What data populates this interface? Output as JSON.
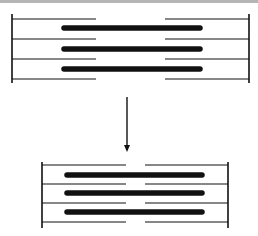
{
  "diagram": {
    "colors": {
      "stroke": "#111111",
      "topbar": "#b5b5b5",
      "background": "#ffffff"
    },
    "relaxed": {
      "z_lines_x": [
        12,
        249
      ],
      "z_line_y": [
        14,
        83
      ],
      "thin_filament_y": [
        19,
        39,
        59,
        79
      ],
      "thin_left": [
        12,
        96
      ],
      "thin_right": [
        165,
        249
      ],
      "thick_filament_y": [
        28,
        49,
        69
      ],
      "thick_x": [
        64,
        200
      ]
    },
    "arrow": {
      "x": 127,
      "y1": 97,
      "y2": 152,
      "direction": "down"
    },
    "contracted": {
      "z_lines_x": [
        42,
        228
      ],
      "z_line_y": [
        162,
        228
      ],
      "thin_filament_y": [
        165,
        184,
        203,
        222
      ],
      "thin_left": [
        42,
        126
      ],
      "thin_right": [
        145,
        228
      ],
      "thick_filament_y": [
        175,
        193,
        212
      ],
      "thick_x": [
        67,
        202
      ]
    }
  }
}
